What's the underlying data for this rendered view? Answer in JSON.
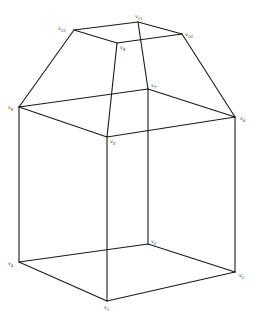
{
  "diagram": {
    "title": "",
    "line_color": "#1a1a1a",
    "vertices": [
      {
        "id": "v1",
        "label": "v1",
        "x": 107,
        "y": 301,
        "lx": 104,
        "ly": 305
      },
      {
        "id": "v2",
        "label": "v2",
        "x": 235,
        "y": 272,
        "lx": 239,
        "ly": 273
      },
      {
        "id": "v3",
        "label": "v3",
        "x": 148,
        "y": 244,
        "lx": 151,
        "ly": 239
      },
      {
        "id": "v4",
        "label": "v4",
        "x": 19,
        "y": 262,
        "lx": 8,
        "ly": 261
      },
      {
        "id": "v5",
        "label": "v5",
        "x": 107,
        "y": 137,
        "lx": 110,
        "ly": 139
      },
      {
        "id": "v6",
        "label": "v6",
        "x": 235,
        "y": 117,
        "lx": 240,
        "ly": 116
      },
      {
        "id": "v7",
        "label": "v7",
        "x": 148,
        "y": 89,
        "lx": 151,
        "ly": 83
      },
      {
        "id": "v8",
        "label": "v8",
        "x": 19,
        "y": 107,
        "lx": 8,
        "ly": 105
      },
      {
        "id": "v9",
        "label": "v9",
        "x": 117,
        "y": 43,
        "lx": 120,
        "ly": 45
      },
      {
        "id": "v10",
        "label": "v10",
        "x": 182,
        "y": 34,
        "lx": 185,
        "ly": 32
      },
      {
        "id": "v11",
        "label": "v11",
        "x": 138,
        "y": 22,
        "lx": 135,
        "ly": 14
      },
      {
        "id": "v12",
        "label": "v12",
        "x": 74,
        "y": 30,
        "lx": 58,
        "ly": 26
      }
    ],
    "edges": [
      [
        "v12",
        "v11"
      ],
      [
        "v11",
        "v10"
      ],
      [
        "v10",
        "v9"
      ],
      [
        "v9",
        "v12"
      ],
      [
        "v12",
        "v8"
      ],
      [
        "v11",
        "v7"
      ],
      [
        "v10",
        "v6"
      ],
      [
        "v9",
        "v5"
      ],
      [
        "v8",
        "v7"
      ],
      [
        "v7",
        "v6"
      ],
      [
        "v6",
        "v5"
      ],
      [
        "v5",
        "v8"
      ],
      [
        "v8",
        "v4"
      ],
      [
        "v7",
        "v3"
      ],
      [
        "v6",
        "v2"
      ],
      [
        "v5",
        "v1"
      ],
      [
        "v4",
        "v3"
      ],
      [
        "v3",
        "v2"
      ],
      [
        "v2",
        "v1"
      ],
      [
        "v1",
        "v4"
      ]
    ]
  }
}
